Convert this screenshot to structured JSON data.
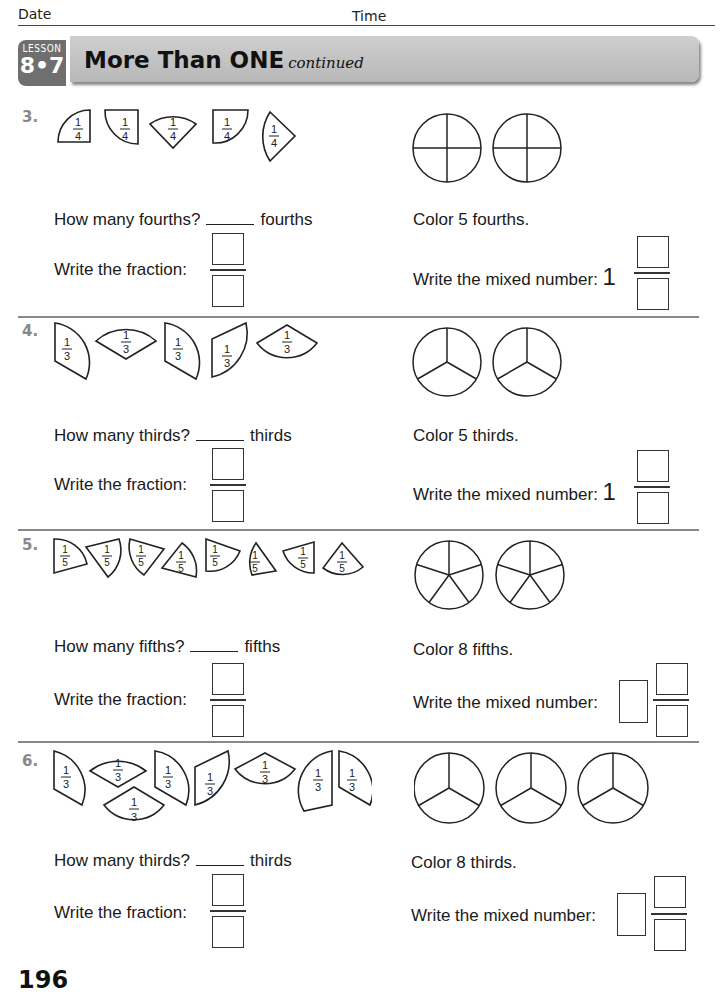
{
  "header": {
    "date_label": "Date",
    "time_label": "Time"
  },
  "banner": {
    "lesson_word": "LESSON",
    "lesson_number": "8•7",
    "title": "More Than ONE",
    "subtitle": "continued"
  },
  "problems": [
    {
      "number": "3.",
      "pieces": [
        "1/4",
        "1/4",
        "1/4",
        "1/4",
        "1/4"
      ],
      "piece_numerator": "1",
      "piece_denominator": "4",
      "circles": 2,
      "circle_parts": 4,
      "how_many_prefix": "How many fourths?",
      "how_many_suffix": "fourths",
      "write_fraction": "Write the fraction:",
      "color_instruction": "Color 5 fourths.",
      "mixed_label": "Write the mixed number:",
      "mixed_whole": "1"
    },
    {
      "number": "4.",
      "pieces": [
        "1/3",
        "1/3",
        "1/3",
        "1/3",
        "1/3"
      ],
      "piece_numerator": "1",
      "piece_denominator": "3",
      "circles": 2,
      "circle_parts": 3,
      "how_many_prefix": "How many thirds?",
      "how_many_suffix": "thirds",
      "write_fraction": "Write the fraction:",
      "color_instruction": "Color 5 thirds.",
      "mixed_label": "Write the mixed number:",
      "mixed_whole": "1"
    },
    {
      "number": "5.",
      "pieces": [
        "1/5",
        "1/5",
        "1/5",
        "1/5",
        "1/5",
        "1/5",
        "1/5",
        "1/5"
      ],
      "piece_numerator": "1",
      "piece_denominator": "5",
      "circles": 2,
      "circle_parts": 5,
      "how_many_prefix": "How many fifths?",
      "how_many_suffix": "fifths",
      "write_fraction": "Write the fraction:",
      "color_instruction": "Color 8 fifths.",
      "mixed_label": "Write the mixed number:",
      "mixed_whole": ""
    },
    {
      "number": "6.",
      "pieces": [
        "1/3",
        "1/3",
        "1/3",
        "1/3",
        "1/3",
        "1/3",
        "1/3",
        "1/3"
      ],
      "piece_numerator": "1",
      "piece_denominator": "3",
      "circles": 3,
      "circle_parts": 3,
      "how_many_prefix": "How many thirds?",
      "how_many_suffix": "thirds",
      "write_fraction": "Write the fraction:",
      "color_instruction": "Color 8 thirds.",
      "mixed_label": "Write the mixed number:",
      "mixed_whole": ""
    }
  ],
  "footer": {
    "page_number": "196"
  }
}
